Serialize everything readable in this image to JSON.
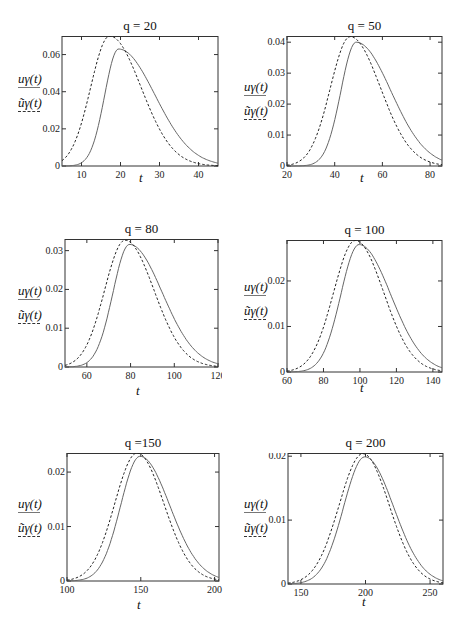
{
  "legend": {
    "series_solid": "uγ(t)",
    "series_dashed": "ũγ(t)"
  },
  "chart_data": [
    {
      "type": "line",
      "title": "q = 20",
      "xlabel": "t",
      "ylabel": "",
      "xlim": [
        5,
        45
      ],
      "ylim": [
        0,
        0.07
      ],
      "xticks": [
        10,
        20,
        30,
        40
      ],
      "yticks": [
        0,
        0.02,
        0.04,
        0.06
      ],
      "ytick_labels": [
        "0",
        "0.02",
        "0.04",
        "0.06"
      ],
      "series": [
        {
          "name": "uγ(t)",
          "style": "solid",
          "peak_t": 19.5,
          "peak_value": 0.063
        },
        {
          "name": "ũγ(t)",
          "style": "dashed",
          "peak_t": 17.2,
          "peak_value": 0.07
        }
      ]
    },
    {
      "type": "line",
      "title": "q = 50",
      "xlabel": "t",
      "xlim": [
        20,
        85
      ],
      "ylim": [
        0,
        0.042
      ],
      "xticks": [
        20,
        40,
        60,
        80
      ],
      "yticks": [
        0,
        0.01,
        0.02,
        0.03,
        0.04
      ],
      "ytick_labels": [
        "0",
        "0.01",
        "0.02",
        "0.03",
        "0.04"
      ],
      "series": [
        {
          "name": "uγ(t)",
          "style": "solid",
          "peak_t": 49,
          "peak_value": 0.04
        },
        {
          "name": "ũγ(t)",
          "style": "dashed",
          "peak_t": 46.5,
          "peak_value": 0.0418
        }
      ]
    },
    {
      "type": "line",
      "title": "q = 80",
      "xlabel": "t",
      "xlim": [
        50,
        120
      ],
      "ylim": [
        0,
        0.033
      ],
      "xticks": [
        60,
        80,
        100,
        120
      ],
      "yticks": [
        0,
        0.01,
        0.02,
        0.03
      ],
      "ytick_labels": [
        "0",
        "0.01",
        "0.02",
        "0.03"
      ],
      "series": [
        {
          "name": "uγ(t)",
          "style": "solid",
          "peak_t": 79.5,
          "peak_value": 0.0316
        },
        {
          "name": "ũγ(t)",
          "style": "dashed",
          "peak_t": 77.5,
          "peak_value": 0.0327
        }
      ]
    },
    {
      "type": "line",
      "title": "q = 100",
      "xlabel": "t",
      "xlim": [
        60,
        145
      ],
      "ylim": [
        0,
        0.029
      ],
      "xticks": [
        60,
        80,
        100,
        120,
        140
      ],
      "yticks": [
        0,
        0.01,
        0.02
      ],
      "ytick_labels": [
        "0",
        "0.01",
        "0.02"
      ],
      "series": [
        {
          "name": "uγ(t)",
          "style": "solid",
          "peak_t": 99.5,
          "peak_value": 0.028
        },
        {
          "name": "ũγ(t)",
          "style": "dashed",
          "peak_t": 97.5,
          "peak_value": 0.0289
        }
      ]
    },
    {
      "type": "line",
      "title": "q =150",
      "xlabel": "t",
      "xlim": [
        100,
        203
      ],
      "ylim": [
        0,
        0.0235
      ],
      "xticks": [
        100,
        150,
        200
      ],
      "yticks": [
        0,
        0.01,
        0.02
      ],
      "ytick_labels": [
        "0",
        "0.01",
        "0.02"
      ],
      "series": [
        {
          "name": "uγ(t)",
          "style": "solid",
          "peak_t": 149.5,
          "peak_value": 0.0229
        },
        {
          "name": "ũγ(t)",
          "style": "dashed",
          "peak_t": 147.5,
          "peak_value": 0.0235
        }
      ]
    },
    {
      "type": "line",
      "title": "q = 200",
      "xlabel": "t",
      "xlim": [
        140,
        260
      ],
      "ylim": [
        0,
        0.0205
      ],
      "xticks": [
        150,
        200,
        250
      ],
      "yticks": [
        0,
        0.01,
        0.02
      ],
      "ytick_labels": [
        "0",
        "0.01",
        "0.02"
      ],
      "series": [
        {
          "name": "uγ(t)",
          "style": "solid",
          "peak_t": 199.5,
          "peak_value": 0.0199
        },
        {
          "name": "ũγ(t)",
          "style": "dashed",
          "peak_t": 198,
          "peak_value": 0.0204
        }
      ]
    }
  ],
  "panels": [
    {
      "title": "q = 20",
      "box": [
        62,
        36,
        156,
        130
      ],
      "legend_pos": [
        18,
        72
      ],
      "xlabel_pos": [
        139,
        170
      ]
    },
    {
      "title": "q = 50",
      "box": [
        287,
        36,
        155,
        130
      ],
      "legend_pos": [
        244,
        80
      ],
      "xlabel_pos": [
        360,
        170
      ]
    },
    {
      "title": "q = 80",
      "box": [
        65,
        239,
        153,
        128
      ],
      "legend_pos": [
        18,
        284
      ],
      "xlabel_pos": [
        136,
        383
      ]
    },
    {
      "title": "q = 100",
      "box": [
        287,
        240,
        155,
        132
      ],
      "legend_pos": [
        244,
        280
      ],
      "xlabel_pos": [
        360,
        380
      ]
    },
    {
      "title": "q =150",
      "box": [
        67,
        453,
        152,
        128
      ],
      "legend_pos": [
        18,
        497
      ],
      "xlabel_pos": [
        137,
        597
      ]
    },
    {
      "title": "q = 200",
      "box": [
        288,
        453,
        155,
        131
      ],
      "legend_pos": [
        244,
        497
      ],
      "xlabel_pos": [
        362,
        594
      ]
    }
  ]
}
